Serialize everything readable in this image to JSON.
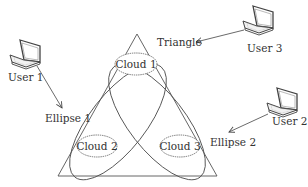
{
  "diagram": {
    "title": "",
    "shapes": {
      "triangle": {
        "label": "Triangle"
      },
      "ellipse1": {
        "label": "Ellipse 1"
      },
      "ellipse2": {
        "label": "Ellipse 2"
      }
    },
    "clouds": [
      {
        "label": "Cloud 1"
      },
      {
        "label": "Cloud 2"
      },
      {
        "label": "Cloud 3"
      }
    ],
    "users": [
      {
        "label": "User 1",
        "icon": "laptop-icon",
        "points_to": "Ellipse 1"
      },
      {
        "label": "User 2",
        "icon": "laptop-icon",
        "points_to": "Ellipse 2"
      },
      {
        "label": "User 3",
        "icon": "laptop-icon",
        "points_to": "Triangle"
      }
    ],
    "colors": {
      "line": "#555555",
      "text": "#333333",
      "background": "#ffffff"
    }
  }
}
